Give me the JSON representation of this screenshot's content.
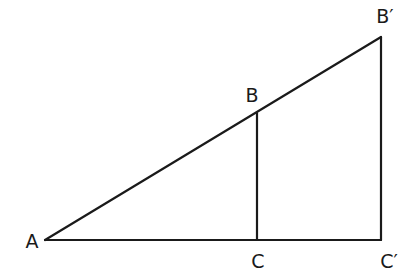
{
  "figure": {
    "points": {
      "A": {
        "x": 45,
        "y": 240
      },
      "B": {
        "x": 257,
        "y": 113
      },
      "C": {
        "x": 257,
        "y": 240
      },
      "Bp": {
        "x": 381,
        "y": 37
      },
      "Cp": {
        "x": 381,
        "y": 240
      }
    },
    "labels": {
      "A": {
        "text": "A",
        "x": 32,
        "y": 242
      },
      "B": {
        "text": "B",
        "x": 252,
        "y": 96
      },
      "C": {
        "text": "C",
        "x": 258,
        "y": 262
      },
      "Bp": {
        "text": "B′",
        "x": 385,
        "y": 17
      },
      "Cp": {
        "text": "C′",
        "x": 389,
        "y": 262
      }
    },
    "segments": [
      {
        "name": "hypotenuse-AB'",
        "from": "A",
        "to": "Bp"
      },
      {
        "name": "base-AC'",
        "from": "A",
        "to": "Cp"
      },
      {
        "name": "leg-BC",
        "from": "B",
        "to": "C"
      },
      {
        "name": "leg-B'C'",
        "from": "Bp",
        "to": "Cp"
      }
    ],
    "line_color": "#1a1a1a"
  }
}
